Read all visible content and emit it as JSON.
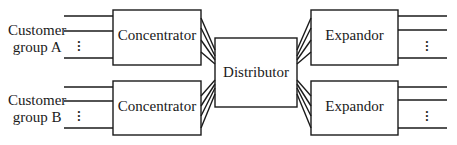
{
  "diagram": {
    "groups": [
      {
        "line1": "Customer",
        "line2": "group A"
      },
      {
        "line1": "Customer",
        "line2": "group B"
      }
    ],
    "concentrators": [
      {
        "label": "Concentrator"
      },
      {
        "label": "Concentrator"
      }
    ],
    "distributor": {
      "label": "Distributor"
    },
    "expandors": [
      {
        "label": "Expandor"
      },
      {
        "label": "Expandor"
      }
    ],
    "ellipsis": "⋮",
    "colors": {
      "stroke": "#1a1a1a",
      "background": "#ffffff"
    }
  }
}
